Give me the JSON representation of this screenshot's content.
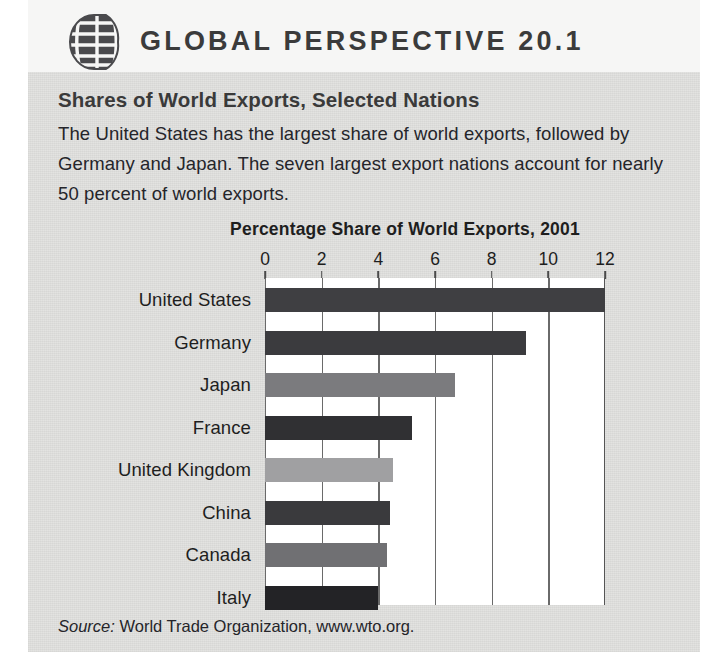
{
  "header": {
    "icon": "globe-icon",
    "title": "GLOBAL PERSPECTIVE 20.1"
  },
  "body": {
    "subhead": "Shares of World Exports, Selected Nations",
    "blurb": "The United States has the largest share of world exports, followed by Germany and Japan. The seven largest export nations account for nearly 50 percent of world exports."
  },
  "source": {
    "label": "Source:",
    "text": "World Trade Organization, www.wto.org."
  },
  "chart_data": {
    "type": "bar",
    "orientation": "horizontal",
    "title": "Percentage Share of World Exports, 2001",
    "xlabel": "",
    "ylabel": "",
    "xlim": [
      0,
      12
    ],
    "ticks": [
      0,
      2,
      4,
      6,
      8,
      10,
      12
    ],
    "grid": true,
    "legend": "none",
    "categories": [
      "United States",
      "Germany",
      "Japan",
      "France",
      "United Kingdom",
      "China",
      "Canada",
      "Italy"
    ],
    "values": [
      12.0,
      9.2,
      6.7,
      5.2,
      4.5,
      4.4,
      4.3,
      4.0
    ],
    "bar_colors": [
      "#3f3f42",
      "#3b3b3e",
      "#7b7b7e",
      "#303033",
      "#a0a0a2",
      "#3a3a3d",
      "#707073",
      "#232326"
    ]
  }
}
